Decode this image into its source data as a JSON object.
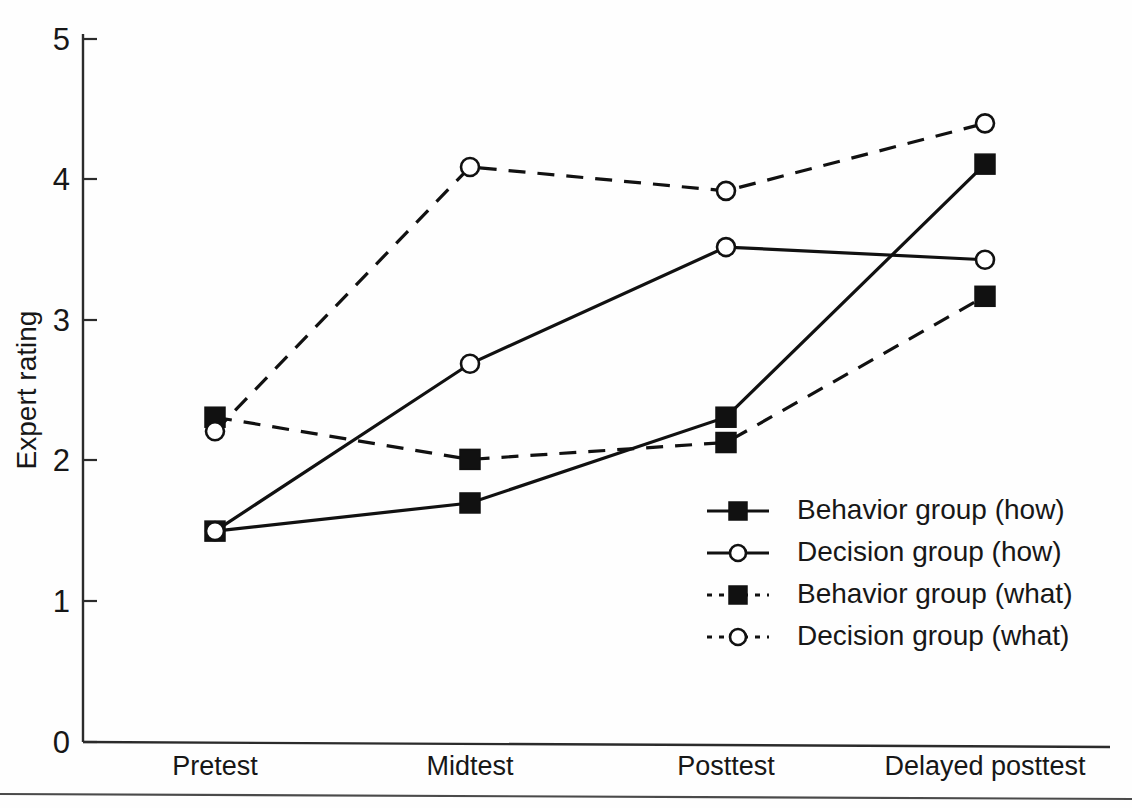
{
  "chart_data": {
    "type": "line",
    "title": "",
    "xlabel": "",
    "ylabel": "Expert rating",
    "categories": [
      "Pretest",
      "Midtest",
      "Posttest",
      "Delayed posttest"
    ],
    "ylim": [
      0,
      5
    ],
    "yticks": [
      0,
      1,
      2,
      3,
      4,
      5
    ],
    "ytick_labels": [
      "0",
      "1",
      "2",
      "3",
      "4",
      "5"
    ],
    "grid": false,
    "legend_position": "center-right",
    "series": [
      {
        "name": "Behavior group (how)",
        "marker": "filled-square",
        "line_style": "solid",
        "values": [
          1.5,
          1.7,
          2.31,
          4.11
        ]
      },
      {
        "name": "Decision group (how)",
        "marker": "open-circle",
        "line_style": "solid",
        "values": [
          1.5,
          2.69,
          3.52,
          3.43
        ]
      },
      {
        "name": "Behavior group (what)",
        "marker": "filled-square",
        "line_style": "dashed",
        "values": [
          2.31,
          2.01,
          2.13,
          3.17
        ]
      },
      {
        "name": "Decision group (what)",
        "marker": "open-circle",
        "line_style": "dashed",
        "values": [
          2.21,
          4.09,
          3.92,
          4.4
        ]
      }
    ]
  },
  "axis": {
    "y_title": "Expert rating",
    "y_tick_0": "0",
    "y_tick_1": "1",
    "y_tick_2": "2",
    "y_tick_3": "3",
    "y_tick_4": "4",
    "y_tick_5": "5",
    "x_tick_0": "Pretest",
    "x_tick_1": "Midtest",
    "x_tick_2": "Posttest",
    "x_tick_3": "Delayed posttest"
  },
  "legend": {
    "entries": [
      {
        "label": "Behavior group (how)"
      },
      {
        "label": "Decision group (how)"
      },
      {
        "label": "Behavior group (what)"
      },
      {
        "label": "Decision group (what)"
      }
    ]
  },
  "colors": {
    "ink": "#111111",
    "axis": "#2b2b2b",
    "background": "#fefefe"
  }
}
